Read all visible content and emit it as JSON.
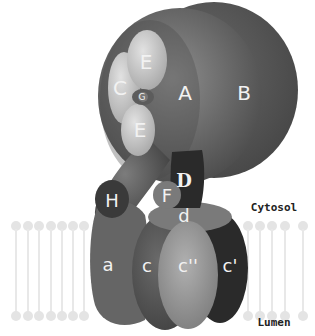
{
  "diagram": {
    "type": "V-ATPase subunit structure",
    "labels": {
      "A": "A",
      "B": "B",
      "C": "C",
      "E_top": "E",
      "E_bottom": "E",
      "G": "G",
      "H": "H",
      "F": "F",
      "D": "D",
      "d": "d",
      "a": "a",
      "c": "c",
      "c_double_prime": "c''",
      "c_prime": "c'"
    },
    "compartments": {
      "cytosol": "Cytosol",
      "lumen": "Lumen"
    },
    "colors": {
      "A": "#6e6e6e",
      "B": "#5a5a5a",
      "E": "#c4c4c4",
      "C": "#bdbdbd",
      "H": "#3c3c3c",
      "D": "#2a2a2a",
      "F": "#7a7a7a",
      "a": "#6a6a6a",
      "c": "#555555",
      "c_double_prime": "#9a9a9a",
      "c_prime": "#2b2b2b",
      "lipid": "#e4e4e4"
    }
  }
}
